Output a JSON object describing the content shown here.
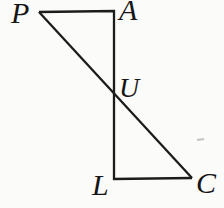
{
  "figure": {
    "vertex_labels": {
      "P": "P",
      "A": "A",
      "U": "U",
      "L": "L",
      "C": "C"
    },
    "colors": {
      "line": "#1c1c1c",
      "label": "#161616",
      "background": "#fbfbfa",
      "artifact": "#9a968f"
    }
  }
}
